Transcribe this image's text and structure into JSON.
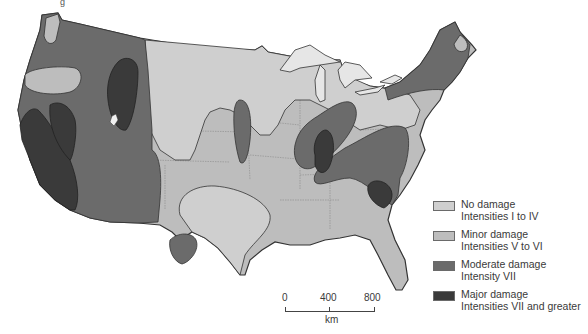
{
  "title_fragment": "g",
  "map": {
    "subject": "Earthquake damage zones, contiguous United States",
    "colors": {
      "no_damage": "#cfcfcf",
      "minor_damage": "#bdbdbd",
      "moderate_damage": "#6b6b6b",
      "major_damage": "#3a3a3a",
      "lakes": "#e6e6e6",
      "border": "#333333",
      "state_lines": "#8a8a8a"
    }
  },
  "legend": {
    "items": [
      {
        "line1": "No damage",
        "line2": "Intensities I to IV",
        "color": "#cfcfcf"
      },
      {
        "line1": "Minor damage",
        "line2": "Intensities V to VI",
        "color": "#bdbdbd"
      },
      {
        "line1": "Moderate damage",
        "line2": "Intensity VII",
        "color": "#6b6b6b"
      },
      {
        "line1": "Major damage",
        "line2": "Intensities VII and greater",
        "color": "#3a3a3a"
      }
    ]
  },
  "scale_bar": {
    "ticks": [
      "0",
      "400",
      "800"
    ],
    "unit": "km"
  }
}
